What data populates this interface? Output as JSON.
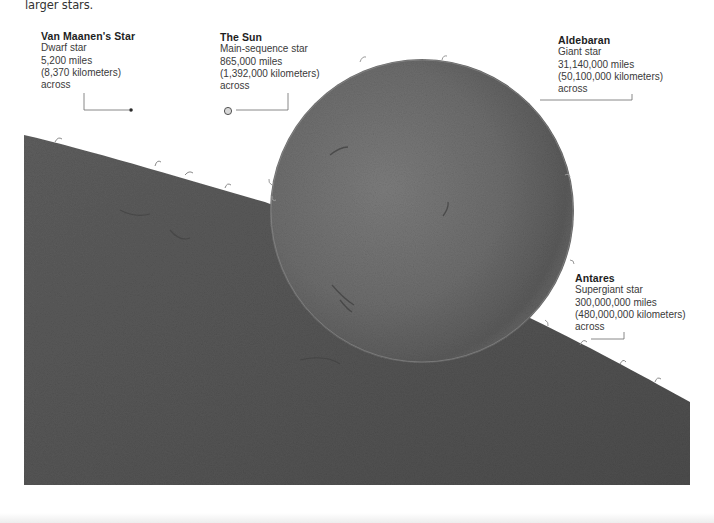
{
  "intro": {
    "text": "larger stars."
  },
  "stars": [
    {
      "name": "Van Maanen's Star",
      "type": "Dwarf star",
      "miles": "5,200 miles",
      "kilometers": "(8,370 kilometers)",
      "suffix": "across"
    },
    {
      "name": "The Sun",
      "type": "Main-sequence star",
      "miles": "865,000 miles",
      "kilometers": "(1,392,000 kilometers)",
      "suffix": "across"
    },
    {
      "name": "Aldebaran",
      "type": "Giant star",
      "miles": "31,140,000 miles",
      "kilometers": "(50,100,000 kilometers)",
      "suffix": "across"
    },
    {
      "name": "Antares",
      "type": "Supergiant star",
      "miles": "300,000,000 miles",
      "kilometers": "(480,000,000 kilometers)",
      "suffix": "across"
    }
  ],
  "colors": {
    "background": "#ffffff",
    "star_surface_dark": "#4a4a4a",
    "star_surface_mid": "#6a6a6a",
    "star_surface_light": "#7e7e7e",
    "leader_line": "#555555",
    "text": "#333333"
  }
}
